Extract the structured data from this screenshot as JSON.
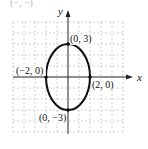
{
  "diagram": {
    "type": "ellipse-graph",
    "equation_implied": "x^2/4 + y^2/9 = 1",
    "top_partial_label": "(−, −)",
    "axes": {
      "x_label": "x",
      "y_label": "y"
    },
    "points": [
      {
        "label": "(0, 3)",
        "x": 0,
        "y": 3
      },
      {
        "label": "(−2, 0)",
        "x": -2,
        "y": 0
      },
      {
        "label": "(2, 0)",
        "x": 2,
        "y": 0
      },
      {
        "label": "(0, −3)",
        "x": 0,
        "y": -3
      }
    ],
    "grid": {
      "x_range": [
        -5,
        5
      ],
      "y_range": [
        -5,
        5
      ],
      "style": "dashed"
    },
    "colors": {
      "curve": "#111111",
      "axis": "#222222",
      "grid": "#bdbdbd"
    }
  }
}
